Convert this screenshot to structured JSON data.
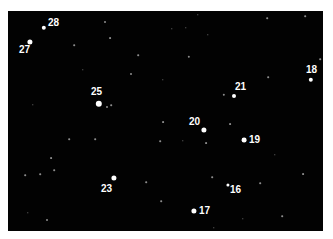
{
  "image": {
    "background": "#020202",
    "star_color": "#ffffff",
    "label_color": "#ffffff"
  },
  "labeled_stars": [
    {
      "id": "28",
      "label": "28",
      "x": 44,
      "y": 28,
      "r": 2.2,
      "lx": 48,
      "ly": 18
    },
    {
      "id": "27",
      "label": "27",
      "x": 30,
      "y": 42,
      "r": 2.6,
      "lx": 19,
      "ly": 45
    },
    {
      "id": "25",
      "label": "25",
      "x": 99,
      "y": 104,
      "r": 3.2,
      "lx": 91,
      "ly": 87
    },
    {
      "id": "21",
      "label": "21",
      "x": 234,
      "y": 96,
      "r": 2.0,
      "lx": 235,
      "ly": 82
    },
    {
      "id": "18",
      "label": "18",
      "x": 311,
      "y": 80,
      "r": 2.2,
      "lx": 306,
      "ly": 65
    },
    {
      "id": "20",
      "label": "20",
      "x": 204,
      "y": 130,
      "r": 2.6,
      "lx": 189,
      "ly": 117
    },
    {
      "id": "19",
      "label": "19",
      "x": 244,
      "y": 140,
      "r": 2.4,
      "lx": 249,
      "ly": 135
    },
    {
      "id": "23",
      "label": "23",
      "x": 114,
      "y": 178,
      "r": 2.6,
      "lx": 101,
      "ly": 184
    },
    {
      "id": "16",
      "label": "16",
      "x": 228,
      "y": 185,
      "r": 1.6,
      "lx": 230,
      "ly": 185
    },
    {
      "id": "17",
      "label": "17",
      "x": 194,
      "y": 211,
      "r": 2.6,
      "lx": 199,
      "ly": 206
    }
  ],
  "background_stars": [
    {
      "x": 105,
      "y": 22,
      "r": 1.0
    },
    {
      "x": 110,
      "y": 38,
      "r": 0.9
    },
    {
      "x": 74,
      "y": 45,
      "r": 0.8
    },
    {
      "x": 138,
      "y": 55,
      "r": 0.8
    },
    {
      "x": 131,
      "y": 74,
      "r": 1.0
    },
    {
      "x": 189,
      "y": 57,
      "r": 1.2
    },
    {
      "x": 224,
      "y": 95,
      "r": 1.2
    },
    {
      "x": 107,
      "y": 107,
      "r": 1.0
    },
    {
      "x": 111,
      "y": 105,
      "r": 0.8
    },
    {
      "x": 163,
      "y": 122,
      "r": 0.9
    },
    {
      "x": 230,
      "y": 124,
      "r": 0.9
    },
    {
      "x": 206,
      "y": 143,
      "r": 0.9
    },
    {
      "x": 160,
      "y": 141,
      "r": 0.8
    },
    {
      "x": 95,
      "y": 139,
      "r": 0.8
    },
    {
      "x": 69,
      "y": 139,
      "r": 0.8
    },
    {
      "x": 51,
      "y": 158,
      "r": 0.9
    },
    {
      "x": 40,
      "y": 174,
      "r": 0.8
    },
    {
      "x": 25,
      "y": 175,
      "r": 0.8
    },
    {
      "x": 54,
      "y": 170,
      "r": 0.8
    },
    {
      "x": 146,
      "y": 182,
      "r": 0.8
    },
    {
      "x": 212,
      "y": 177,
      "r": 0.8
    },
    {
      "x": 260,
      "y": 183,
      "r": 0.8
    },
    {
      "x": 303,
      "y": 174,
      "r": 0.9
    },
    {
      "x": 161,
      "y": 201,
      "r": 0.8
    },
    {
      "x": 47,
      "y": 220,
      "r": 1.0
    },
    {
      "x": 28,
      "y": 213,
      "r": 0.7
    },
    {
      "x": 282,
      "y": 216,
      "r": 0.8
    },
    {
      "x": 243,
      "y": 219,
      "r": 0.7
    },
    {
      "x": 214,
      "y": 228,
      "r": 0.7
    },
    {
      "x": 268,
      "y": 77,
      "r": 0.8
    },
    {
      "x": 305,
      "y": 16,
      "r": 0.8
    },
    {
      "x": 198,
      "y": 15,
      "r": 0.7
    },
    {
      "x": 267,
      "y": 18,
      "r": 0.8
    },
    {
      "x": 320,
      "y": 59,
      "r": 0.8
    },
    {
      "x": 83,
      "y": 70,
      "r": 0.7
    },
    {
      "x": 163,
      "y": 80,
      "r": 0.7
    },
    {
      "x": 186,
      "y": 28,
      "r": 0.7
    },
    {
      "x": 208,
      "y": 35,
      "r": 0.7
    },
    {
      "x": 172,
      "y": 29,
      "r": 0.7
    },
    {
      "x": 183,
      "y": 141,
      "r": 0.7
    },
    {
      "x": 275,
      "y": 155,
      "r": 0.7
    },
    {
      "x": 33,
      "y": 105,
      "r": 0.7
    }
  ]
}
